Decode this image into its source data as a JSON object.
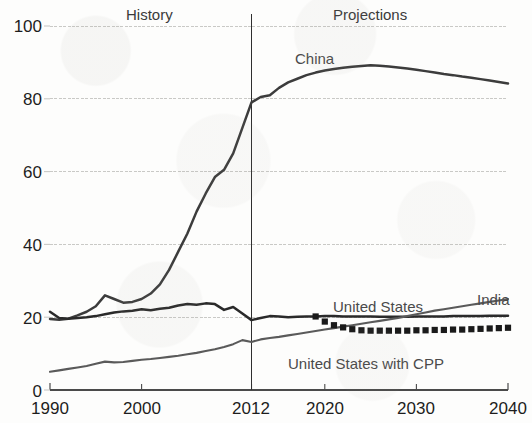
{
  "chart_data": {
    "type": "line",
    "title": "",
    "xlabel": "",
    "ylabel": "",
    "xlim": [
      1990,
      2040
    ],
    "ylim": [
      0,
      100
    ],
    "grid": true,
    "legend_position": "inline-labels",
    "x_ticks": [
      "1990",
      "2000",
      "2012",
      "2020",
      "2030",
      "2040"
    ],
    "x_tick_values": [
      1990,
      2000,
      2012,
      2020,
      2030,
      2040
    ],
    "y_ticks": [
      "0",
      "20",
      "40",
      "60",
      "80",
      "100"
    ],
    "y_tick_values": [
      0,
      20,
      40,
      60,
      80,
      100
    ],
    "annotations": [
      {
        "text": "History",
        "x": 2001,
        "y": 100,
        "name": "history-region-label"
      },
      {
        "text": "Projections",
        "x": 2027,
        "y": 100,
        "name": "projections-region-label"
      }
    ],
    "divider": {
      "x": 2012,
      "label": "2012",
      "name": "history-projections-divider"
    },
    "series": [
      {
        "name": "China",
        "label_x": 2017,
        "label_y": 91,
        "style": "solid",
        "color": "#3c3c3c",
        "x": [
          1990,
          1991,
          1992,
          1993,
          1994,
          1995,
          1996,
          1997,
          1998,
          1999,
          2000,
          2001,
          2002,
          2003,
          2004,
          2005,
          2006,
          2007,
          2008,
          2009,
          2010,
          2011,
          2012,
          2013,
          2014,
          2015,
          2016,
          2017,
          2018,
          2019,
          2020,
          2021,
          2022,
          2023,
          2024,
          2025,
          2026,
          2027,
          2028,
          2029,
          2030,
          2031,
          2032,
          2033,
          2034,
          2035,
          2036,
          2037,
          2038,
          2039,
          2040
        ],
        "values": [
          19.5,
          19.3,
          19.6,
          20.5,
          21.5,
          23.0,
          26.0,
          25.0,
          24.0,
          24.2,
          25.0,
          26.5,
          29.0,
          33.0,
          38.0,
          43.0,
          49.0,
          54.0,
          58.5,
          60.5,
          65.0,
          72.0,
          79.0,
          80.5,
          81.0,
          83.0,
          84.5,
          85.5,
          86.5,
          87.2,
          87.8,
          88.2,
          88.5,
          88.8,
          89.0,
          89.2,
          89.1,
          88.9,
          88.6,
          88.3,
          88.0,
          87.6,
          87.2,
          86.8,
          86.5,
          86.1,
          85.8,
          85.4,
          85.0,
          84.6,
          84.2
        ]
      },
      {
        "name": "United States",
        "label_x": 2020,
        "label_y": 26,
        "style": "solid",
        "color": "#2a2a2a",
        "x": [
          1990,
          1991,
          1992,
          1993,
          1994,
          1995,
          1996,
          1997,
          1998,
          1999,
          2000,
          2001,
          2002,
          2003,
          2004,
          2005,
          2006,
          2007,
          2008,
          2009,
          2010,
          2011,
          2012,
          2013,
          2014,
          2015,
          2016,
          2017,
          2018,
          2019,
          2020,
          2021,
          2022,
          2023,
          2024,
          2025,
          2026,
          2027,
          2028,
          2029,
          2030,
          2031,
          2032,
          2033,
          2034,
          2035,
          2036,
          2037,
          2038,
          2039,
          2040
        ],
        "values": [
          21.5,
          19.8,
          19.6,
          19.8,
          20.0,
          20.3,
          20.8,
          21.3,
          21.6,
          21.8,
          22.2,
          21.9,
          22.3,
          22.6,
          23.2,
          23.6,
          23.4,
          23.8,
          23.6,
          22.0,
          22.8,
          21.0,
          19.2,
          19.8,
          20.3,
          20.2,
          20.0,
          20.1,
          20.2,
          20.2,
          20.3,
          20.3,
          20.2,
          20.2,
          20.2,
          20.2,
          20.1,
          20.1,
          20.1,
          20.1,
          20.2,
          20.2,
          20.2,
          20.2,
          20.3,
          20.3,
          20.3,
          20.3,
          20.4,
          20.4,
          20.4
        ]
      },
      {
        "name": "India",
        "label_x": 2036,
        "label_y": 29,
        "style": "solid",
        "color": "#5a5a5a",
        "x": [
          1990,
          1991,
          1992,
          1993,
          1994,
          1995,
          1996,
          1997,
          1998,
          1999,
          2000,
          2001,
          2002,
          2003,
          2004,
          2005,
          2006,
          2007,
          2008,
          2009,
          2010,
          2011,
          2012,
          2013,
          2014,
          2015,
          2016,
          2017,
          2018,
          2019,
          2020,
          2021,
          2022,
          2023,
          2024,
          2025,
          2026,
          2027,
          2028,
          2029,
          2030,
          2031,
          2032,
          2033,
          2034,
          2035,
          2036,
          2037,
          2038,
          2039,
          2040
        ],
        "values": [
          5.0,
          5.4,
          5.8,
          6.2,
          6.6,
          7.2,
          7.8,
          7.6,
          7.7,
          8.0,
          8.3,
          8.5,
          8.8,
          9.1,
          9.4,
          9.8,
          10.2,
          10.7,
          11.2,
          11.8,
          12.6,
          13.7,
          13.2,
          13.9,
          14.3,
          14.6,
          15.0,
          15.4,
          15.8,
          16.2,
          16.6,
          17.0,
          17.4,
          17.8,
          18.2,
          18.6,
          19.0,
          19.4,
          19.8,
          20.3,
          20.8,
          21.3,
          21.8,
          22.2,
          22.6,
          23.0,
          23.4,
          23.8,
          24.2,
          24.6,
          25.0
        ]
      },
      {
        "name": "United States with CPP",
        "label_x": 2028,
        "label_y": 9,
        "style": "dotted-squares",
        "color": "#1a1a1a",
        "x": [
          2019,
          2020,
          2021,
          2022,
          2023,
          2024,
          2025,
          2026,
          2027,
          2028,
          2029,
          2030,
          2031,
          2032,
          2033,
          2034,
          2035,
          2036,
          2037,
          2038,
          2039,
          2040
        ],
        "values": [
          20.2,
          18.8,
          17.8,
          17.2,
          16.7,
          16.4,
          16.3,
          16.3,
          16.3,
          16.3,
          16.3,
          16.4,
          16.4,
          16.5,
          16.5,
          16.6,
          16.6,
          16.7,
          16.8,
          16.9,
          17.0,
          17.1
        ]
      }
    ]
  },
  "axes": {
    "y_labels": [
      "100",
      "80",
      "60",
      "40",
      "20",
      "0"
    ],
    "x_labels": [
      "1990",
      "2000",
      "2012",
      "2020",
      "2030",
      "2040"
    ]
  },
  "colors": {
    "china_line": "#3c3c3c",
    "us_line": "#2a2a2a",
    "india_line": "#5a5a5a",
    "cpp_line": "#1a1a1a",
    "gridline": "#c9c9c6",
    "axis": "#4a4a4a",
    "text": "#1d1d1d",
    "background": "#fdfdfc"
  }
}
